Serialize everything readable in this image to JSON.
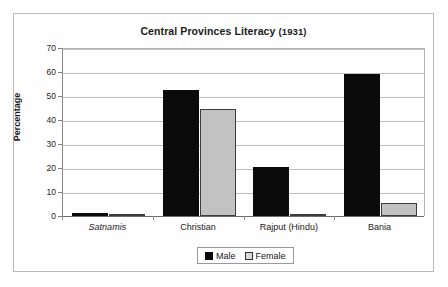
{
  "figure": {
    "background_color": "#ffffff",
    "frame_color": "#b9b9b9"
  },
  "chart_data": {
    "type": "bar",
    "title": "Central Provinces Literacy (1931)",
    "title_main": "Central Provinces Literacy",
    "title_year": "(1931)",
    "xlabel": "",
    "ylabel": "Percentage",
    "ylim": [
      0,
      70
    ],
    "yticks": [
      0,
      10,
      20,
      30,
      40,
      50,
      60,
      70
    ],
    "ytick_labels": [
      "0",
      "10",
      "20",
      "30",
      "40",
      "50",
      "60",
      "70"
    ],
    "grid": "horizontal",
    "legend_position": "bottom-center",
    "categories": [
      "Satnamis",
      "Christian",
      "Rajput (Hindu)",
      "Bania"
    ],
    "category_styles": [
      "italic",
      "normal",
      "normal",
      "normal"
    ],
    "series": [
      {
        "name": "Male",
        "color": "#0b0b0b",
        "values": [
          1.1,
          52.5,
          20.3,
          59.0
        ]
      },
      {
        "name": "Female",
        "color": "#c2c2c2",
        "edge_color": "#3d3d3d",
        "values": [
          0.2,
          44.5,
          0.7,
          5.5
        ]
      }
    ]
  },
  "legend": {
    "entries": [
      {
        "label": "Male",
        "swatch": "black-square-icon"
      },
      {
        "label": "Female",
        "swatch": "white-square-icon"
      }
    ]
  }
}
